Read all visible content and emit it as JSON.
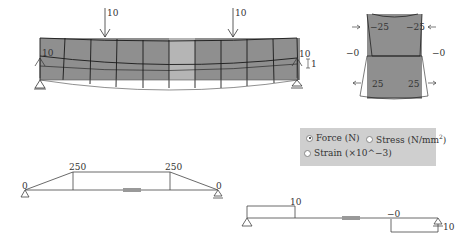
{
  "beam_model": {
    "load_left": "10",
    "load_right": "10",
    "reaction_left": "10",
    "reaction_right": "10",
    "scale_label": "1",
    "colors": {
      "element_dark": "#8f8f8f",
      "element_light": "#b5b5b5",
      "mesh": "#1a1a1a"
    }
  },
  "section_view": {
    "top_left": "−25",
    "top_right": "−25",
    "mid_left": "−0",
    "mid_right": "−0",
    "bottom_left": "25",
    "bottom_right": "25"
  },
  "display_options": {
    "options": [
      {
        "label": "Force (N)",
        "selected": true
      },
      {
        "label": "Stress (N/mm",
        "sup": "2",
        "suffix": ")",
        "selected": false
      },
      {
        "label": "Strain (×10^−3)",
        "selected": false
      }
    ]
  },
  "moment_diagram": {
    "values": [
      "0",
      "250",
      "250",
      "0"
    ]
  },
  "shear_diagram": {
    "values": [
      "10",
      "−0",
      "10"
    ]
  }
}
